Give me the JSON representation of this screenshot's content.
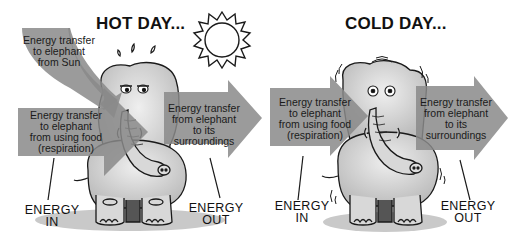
{
  "panels": [
    {
      "title": "HOT DAY...",
      "sun_label": "Energy transfer\nto elephant\nfrom Sun",
      "in_label": "Energy transfer\nto elephant\nfrom using food\n(respiration)",
      "out_label": "Energy transfer\nfrom elephant\nto its\nsurroundings",
      "energy_in": "ENERGY\nIN",
      "energy_out": "ENERGY\nOUT",
      "elephant_state": "hot-sweating"
    },
    {
      "title": "COLD DAY...",
      "in_label": "Energy transfer\nto elephant\nfrom using food\n(respiration)",
      "out_label": "Energy transfer\nfrom elephant\nto its\nsurroundings",
      "energy_in": "ENERGY\nIN",
      "energy_out": "ENERGY\nOUT",
      "elephant_state": "cold-shivering"
    }
  ],
  "colors": {
    "arrow": "#8a8a8a",
    "elephant_fill": "#d6d6d6",
    "outline": "#1a1a1a",
    "background": "#ffffff"
  }
}
